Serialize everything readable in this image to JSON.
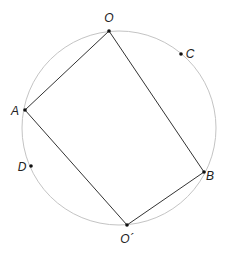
{
  "diagram": {
    "circle": {
      "cx": 119,
      "cy": 128,
      "r": 97,
      "stroke": "#c4c4c4"
    },
    "line_color": "#333333",
    "points": [
      {
        "id": "O",
        "label": "O",
        "x": 109,
        "y": 31,
        "lx": 109,
        "ly": 22
      },
      {
        "id": "C",
        "label": "C",
        "x": 181,
        "y": 54,
        "lx": 190,
        "ly": 58
      },
      {
        "id": "A",
        "label": "A",
        "x": 25,
        "y": 110,
        "lx": 15,
        "ly": 115
      },
      {
        "id": "D",
        "label": "D",
        "x": 31,
        "y": 166,
        "lx": 22,
        "ly": 171
      },
      {
        "id": "B",
        "label": "B",
        "x": 204,
        "y": 172,
        "lx": 210,
        "ly": 180
      },
      {
        "id": "O2",
        "label": "O´",
        "x": 127,
        "y": 225,
        "lx": 127,
        "ly": 243
      }
    ],
    "quadrilateral": [
      "O",
      "B",
      "O2",
      "A"
    ]
  }
}
